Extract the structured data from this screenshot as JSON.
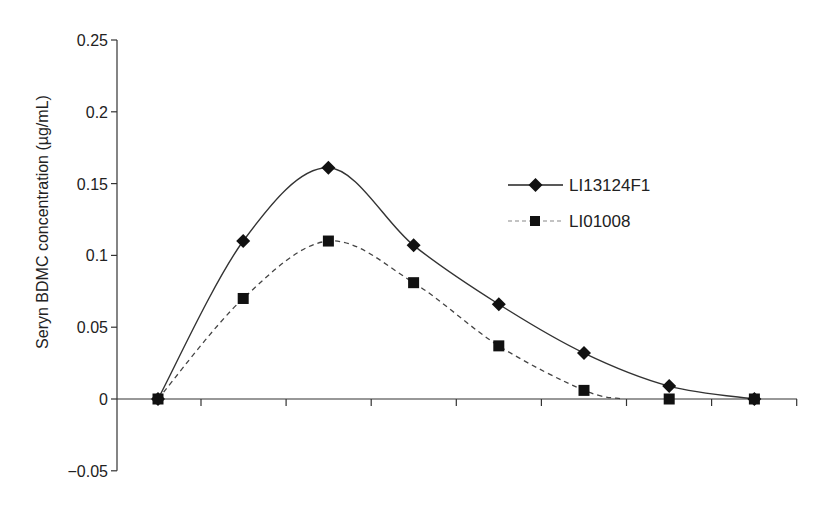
{
  "chart_data": {
    "type": "line",
    "title": "",
    "xlabel": "",
    "ylabel": "Seryn BDMC concentration (µg/mL)",
    "ylim": [
      -0.05,
      0.25
    ],
    "yticks": [
      -0.05,
      0,
      0.05,
      0.1,
      0.15,
      0.2,
      0.25
    ],
    "ytick_labels": [
      "−0.05",
      "0",
      "0.05",
      "0.1",
      "0.15",
      "0.2",
      "0.25"
    ],
    "x_tick_count": 8,
    "x": [
      0,
      1,
      2,
      3,
      4,
      5,
      6,
      7
    ],
    "grid": false,
    "legend_position": "upper right (inside)",
    "series": [
      {
        "name": "LI13124F1",
        "marker": "diamond",
        "line": "solid",
        "values": [
          0,
          0.11,
          0.161,
          0.107,
          0.066,
          0.032,
          0.009,
          0
        ]
      },
      {
        "name": "LI01008",
        "marker": "square",
        "line": "dashed",
        "values": [
          0,
          0.07,
          0.11,
          0.081,
          0.037,
          0.006,
          0,
          0
        ]
      }
    ]
  },
  "colors": {
    "series_1": "#222222",
    "series_2": "#333333",
    "axis": "#333333"
  }
}
